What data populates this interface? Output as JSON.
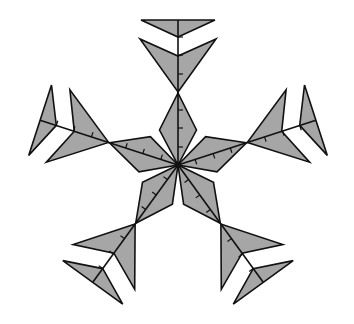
{
  "figure": {
    "title": "",
    "type": "five-fold symmetric snowflake figure",
    "width": 354,
    "height": 324,
    "center": [
      178,
      165
    ],
    "colors": {
      "fill": "#a6a6a6",
      "stroke": "#111111",
      "background": "#ffffff"
    },
    "arm_angles_deg": [
      -90,
      -18,
      54,
      126,
      198
    ],
    "arm_names": [
      "arm-top",
      "arm-right",
      "arm-bottom-right",
      "arm-bottom-left",
      "arm-left"
    ],
    "arm_geometry": {
      "spine_length": 145,
      "kite": [
        [
          0,
          0
        ],
        [
          35,
          18.5
        ],
        [
          72,
          0
        ],
        [
          35,
          -18.5
        ]
      ],
      "chevron": [
        [
          73,
          0
        ],
        [
          126,
          38
        ],
        [
          109,
          0
        ],
        [
          126,
          -38
        ]
      ],
      "cap": [
        [
          128,
          0
        ],
        [
          145,
          37
        ],
        [
          145,
          -37
        ]
      ],
      "tick_positions": [
        18,
        37,
        55,
        91,
        110,
        128
      ],
      "tick_length": 5
    }
  }
}
